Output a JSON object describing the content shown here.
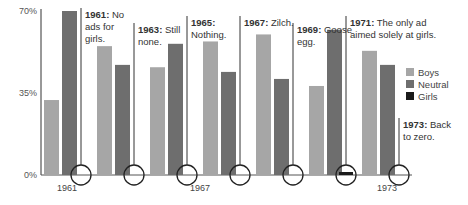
{
  "chart_data": {
    "type": "bar",
    "title": "",
    "xlabel": "",
    "ylabel": "",
    "ylim": [
      0,
      70
    ],
    "yticks": [
      "0%",
      "35%",
      "70%"
    ],
    "ytick_values": [
      0,
      35,
      70
    ],
    "grid": false,
    "legend_position": "right",
    "colors": {
      "Boys": "#a6a6a6",
      "Neutral": "#6e6e6e",
      "Girls": "#1a1a1a"
    },
    "categories": [
      "1961",
      "1963",
      "1965",
      "1967",
      "1969",
      "1971",
      "1973"
    ],
    "x_labels_shown": [
      "1961",
      "1967",
      "1973"
    ],
    "series": [
      {
        "name": "Boys",
        "values": [
          32,
          55,
          46,
          57,
          60,
          38,
          53
        ]
      },
      {
        "name": "Neutral",
        "values": [
          70,
          47,
          56,
          44,
          41,
          62,
          47
        ]
      },
      {
        "name": "Girls",
        "values": [
          0,
          0,
          0,
          0,
          0,
          1,
          0
        ]
      }
    ],
    "annotations": [
      {
        "year": "1961",
        "text": "No ads for girls."
      },
      {
        "year": "1963",
        "text": "Still none."
      },
      {
        "year": "1965",
        "text": "Nothing."
      },
      {
        "year": "1967",
        "text": "Zilch."
      },
      {
        "year": "1969",
        "text": "Goose egg."
      },
      {
        "year": "1971",
        "text": "The only ad aimed solely at girls."
      },
      {
        "year": "1973",
        "text": "Back to zero."
      }
    ]
  }
}
